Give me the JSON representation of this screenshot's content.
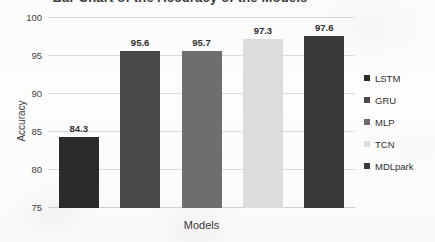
{
  "chart_data": {
    "type": "bar",
    "title": "Bar Chart of the Accuracy of the Models",
    "xlabel": "Models",
    "ylabel": "Accuracy",
    "categories": [
      "LSTM",
      "GRU",
      "MLP",
      "TCN",
      "MDLpark"
    ],
    "values": [
      84.3,
      95.6,
      95.7,
      97.3,
      97.6
    ],
    "value_labels": [
      "84.3",
      "95.6",
      "95.7",
      "97.3",
      "97.6"
    ],
    "ylim": [
      75,
      100
    ],
    "yticks": [
      100,
      95,
      90,
      85,
      80,
      75
    ],
    "ytick_labels": [
      "100",
      "95",
      "90",
      "85",
      "80",
      "75"
    ],
    "grid": true,
    "legend_position": "right",
    "series": [
      {
        "name": "Accuracy",
        "values": [
          84.3,
          95.6,
          95.7,
          97.3,
          97.6
        ]
      }
    ],
    "colors": [
      "#2b2b2b",
      "#4a4a4a",
      "#6e6e6e",
      "#dcdcdc",
      "#3a3a3a"
    ]
  },
  "legend": {
    "items": [
      {
        "label": "LSTM",
        "color": "#2b2b2b"
      },
      {
        "label": "GRU",
        "color": "#4a4a4a"
      },
      {
        "label": "MLP",
        "color": "#6e6e6e"
      },
      {
        "label": "TCN",
        "color": "#dcdcdc"
      },
      {
        "label": "MDLpark",
        "color": "#3a3a3a"
      }
    ]
  }
}
